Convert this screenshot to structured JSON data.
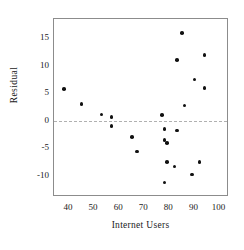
{
  "chart_data": {
    "type": "scatter",
    "title": "",
    "xlabel": "Internet Users",
    "ylabel": "Residual",
    "xlim": [
      34,
      103
    ],
    "ylim": [
      -13.5,
      18.5
    ],
    "xticks": [
      40,
      50,
      60,
      70,
      80,
      90,
      100
    ],
    "yticks": [
      15,
      10,
      5,
      0,
      -5,
      -10
    ],
    "grid": false,
    "legend": null,
    "reference_lines": [
      {
        "axis": "y",
        "value": 0,
        "style": "dashed",
        "color": "#b0b0b0"
      }
    ],
    "marker": {
      "shape": "circle",
      "color": "#111111",
      "size": 3.6
    },
    "points": [
      {
        "x": 38,
        "y": 5.8
      },
      {
        "x": 45,
        "y": 3.0
      },
      {
        "x": 53,
        "y": 1.1
      },
      {
        "x": 57,
        "y": 0.7
      },
      {
        "x": 57,
        "y": -1.0
      },
      {
        "x": 65,
        "y": -3.0
      },
      {
        "x": 67,
        "y": -5.6
      },
      {
        "x": 77,
        "y": 1.0
      },
      {
        "x": 78,
        "y": -1.5
      },
      {
        "x": 78,
        "y": -3.5
      },
      {
        "x": 79,
        "y": -4.0
      },
      {
        "x": 79,
        "y": -7.5
      },
      {
        "x": 78,
        "y": -11.2
      },
      {
        "x": 82,
        "y": -8.3
      },
      {
        "x": 83,
        "y": 11.0
      },
      {
        "x": 83,
        "y": -1.8
      },
      {
        "x": 85,
        "y": 16.0
      },
      {
        "x": 86,
        "y": 2.8
      },
      {
        "x": 89,
        "y": -9.8
      },
      {
        "x": 90,
        "y": 7.5
      },
      {
        "x": 92,
        "y": -7.5
      },
      {
        "x": 94,
        "y": 12.0
      },
      {
        "x": 94,
        "y": 6.0
      }
    ]
  }
}
